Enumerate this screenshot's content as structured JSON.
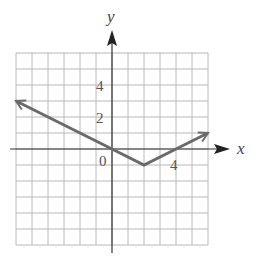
{
  "chart_data": {
    "type": "line",
    "title": "",
    "xlabel": "x",
    "ylabel": "y",
    "xlim": [
      -6,
      6
    ],
    "ylim": [
      -6,
      6
    ],
    "grid": true,
    "grid_step": 1,
    "tick_labels": {
      "x": [
        {
          "value": 4,
          "label": "4"
        }
      ],
      "y": [
        {
          "value": 2,
          "label": "2"
        },
        {
          "value": 4,
          "label": "4"
        }
      ],
      "origin": "0"
    },
    "series": [
      {
        "name": "y = (1/2)|x - 2| - 1",
        "points": [
          [
            -6,
            3
          ],
          [
            0,
            0
          ],
          [
            2,
            -1
          ],
          [
            4,
            0
          ],
          [
            6,
            1
          ]
        ],
        "arrows": "both",
        "color": "#666666"
      }
    ],
    "vertex": [
      2,
      -1
    ]
  },
  "labels": {
    "x_axis": "x",
    "y_axis": "y",
    "origin": "0",
    "tick_x4": "4",
    "tick_y2": "2",
    "tick_y4": "4"
  },
  "colors": {
    "grid": "#b8b8b8",
    "axis": "#333333",
    "curve": "#6a6a6a"
  }
}
